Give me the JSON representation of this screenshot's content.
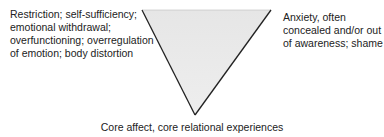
{
  "diagram": {
    "type": "inverted-triangle",
    "fill_color": "#e8e8e8",
    "stroke_color": "#222222",
    "corners": {
      "top_left": {
        "lines": [
          "Restriction; self-sufficiency;",
          "emotional withdrawal;",
          "overfunctioning; overregulation",
          "of emotion; body distortion"
        ]
      },
      "top_right": {
        "lines": [
          "Anxiety, often",
          "concealed and/or out",
          "of awareness; shame"
        ]
      },
      "bottom": {
        "lines": [
          "Core affect, core relational experiences"
        ]
      }
    }
  }
}
